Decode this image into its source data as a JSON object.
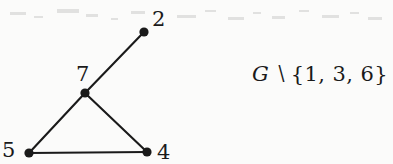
{
  "figure": {
    "name": "induced-subgraph-diagram",
    "background_color": "#fbfbfa",
    "ink_color": "#1a1a1a",
    "width": 393,
    "height": 164
  },
  "graph": {
    "nodes": [
      {
        "id": "2",
        "label": "2",
        "cx": 144,
        "cy": 32,
        "r": 4.6,
        "label_x": 152,
        "label_y": 9
      },
      {
        "id": "7",
        "label": "7",
        "cx": 85,
        "cy": 93,
        "r": 4.6,
        "label_x": 76,
        "label_y": 64
      },
      {
        "id": "5",
        "label": "5",
        "cx": 29,
        "cy": 153,
        "r": 4.6,
        "label_x": 2,
        "label_y": 140
      },
      {
        "id": "4",
        "label": "4",
        "cx": 147,
        "cy": 152,
        "r": 4.6,
        "label_x": 157,
        "label_y": 142
      }
    ],
    "edges": [
      {
        "from": "7",
        "to": "2",
        "x1": 85,
        "y1": 93,
        "x2": 144,
        "y2": 32
      },
      {
        "from": "7",
        "to": "5",
        "x1": 85,
        "y1": 93,
        "x2": 29,
        "y2": 153
      },
      {
        "from": "7",
        "to": "4",
        "x1": 85,
        "y1": 93,
        "x2": 147,
        "y2": 152
      },
      {
        "from": "5",
        "to": "4",
        "x1": 29,
        "y1": 153,
        "x2": 147,
        "y2": 152
      }
    ],
    "edge_width": 2.1
  },
  "caption": {
    "full_text": "G ∖ {1, 3, 6}",
    "graph_symbol": "G",
    "operator": "∖",
    "removed_set": "{1, 3, 6}",
    "removed_vertices": [
      "1",
      "3",
      "6"
    ]
  },
  "noise": {
    "speckles": [
      {
        "x": 10,
        "y": 12,
        "w": 16,
        "h": 3
      },
      {
        "x": 34,
        "y": 16,
        "w": 9,
        "h": 2
      },
      {
        "x": 57,
        "y": 9,
        "w": 22,
        "h": 4
      },
      {
        "x": 86,
        "y": 14,
        "w": 12,
        "h": 3
      },
      {
        "x": 111,
        "y": 18,
        "w": 7,
        "h": 2
      },
      {
        "x": 131,
        "y": 11,
        "w": 14,
        "h": 3
      },
      {
        "x": 177,
        "y": 15,
        "w": 19,
        "h": 3
      },
      {
        "x": 205,
        "y": 10,
        "w": 11,
        "h": 2
      },
      {
        "x": 228,
        "y": 17,
        "w": 16,
        "h": 3
      },
      {
        "x": 253,
        "y": 12,
        "w": 8,
        "h": 2
      },
      {
        "x": 272,
        "y": 16,
        "w": 13,
        "h": 3
      },
      {
        "x": 299,
        "y": 10,
        "w": 10,
        "h": 2
      },
      {
        "x": 322,
        "y": 15,
        "w": 17,
        "h": 3
      },
      {
        "x": 350,
        "y": 12,
        "w": 9,
        "h": 2
      },
      {
        "x": 368,
        "y": 17,
        "w": 14,
        "h": 3
      },
      {
        "x": 300,
        "y": 118,
        "w": 7,
        "h": 3
      }
    ]
  }
}
